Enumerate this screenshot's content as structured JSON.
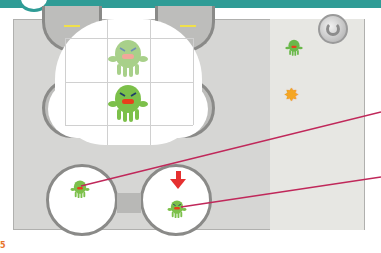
{
  "header": {
    "bar_color": "#2f9c96"
  },
  "board": {
    "background": "#d6d6d4",
    "grid": {
      "rows": 2,
      "cols": 3
    },
    "monsters": [
      {
        "name": "monster-faded",
        "color": "#a8d08a",
        "state": "ghost"
      },
      {
        "name": "monster-active",
        "color": "#7cc04a",
        "state": "current"
      }
    ]
  },
  "sidebar": {
    "items": [
      {
        "name": "monster-icon",
        "color": "#6ab84a"
      },
      {
        "name": "star-icon",
        "glyph": "✸",
        "color": "#f5a623"
      }
    ],
    "refresh_button": {
      "name": "refresh-button"
    }
  },
  "slots": [
    {
      "name": "left-slot",
      "monster_color": "#7cc04a"
    },
    {
      "name": "right-slot",
      "monster_color": "#7cc04a",
      "indicator": "down-arrow",
      "indicator_color": "#e53030"
    }
  ],
  "callout_lines": {
    "color": "#c0285a",
    "count": 2
  },
  "page": {
    "number": "5"
  }
}
